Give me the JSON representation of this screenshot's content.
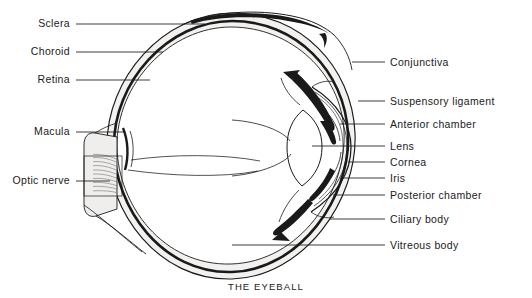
{
  "figure": {
    "caption": "THE EYEBALL",
    "ink_color": "#1a1a1a",
    "stipple_color": "#8a8a8a",
    "sclera_fill": "#f0efed",
    "background": "#ffffff"
  },
  "labels_left": [
    {
      "text": "Sclera",
      "name": "label-sclera",
      "x": 30,
      "y": 18,
      "leader_x1": 76,
      "leader_x2": 205,
      "leader_y": 24
    },
    {
      "text": "Choroid",
      "name": "label-choroid",
      "x": 21,
      "y": 46,
      "leader_x1": 76,
      "leader_x2": 163,
      "leader_y": 52
    },
    {
      "text": "Retina",
      "name": "label-retina",
      "x": 31,
      "y": 74,
      "leader_x1": 76,
      "leader_x2": 150,
      "leader_y": 80
    },
    {
      "text": "Macula",
      "name": "label-macula",
      "x": 26,
      "y": 126,
      "leader_x1": 76,
      "leader_x2": 125,
      "leader_y": 132
    },
    {
      "text": "Optic nerve",
      "name": "label-optic-nerve",
      "x": 6,
      "y": 175,
      "leader_x1": 76,
      "leader_x2": 110,
      "leader_y": 181
    }
  ],
  "labels_right": [
    {
      "text": "Suspensory  ligament",
      "name": "label-suspensory-ligament",
      "x": 390,
      "y": 96,
      "leader_x1": 358,
      "leader_x2": 385,
      "leader_y": 101
    },
    {
      "text": "Conjunctiva",
      "name": "label-conjunctiva",
      "x": 390,
      "y": 57,
      "leader_x1": 352,
      "leader_x2": 385,
      "leader_y": 62
    },
    {
      "text": "Anterior chamber",
      "name": "label-anterior-chamber",
      "x": 390,
      "y": 119,
      "leader_x1": 340,
      "leader_x2": 385,
      "leader_y": 124
    },
    {
      "text": "Lens",
      "name": "label-lens",
      "x": 390,
      "y": 141,
      "leader_x1": 312,
      "leader_x2": 385,
      "leader_y": 146
    },
    {
      "text": "Cornea",
      "name": "label-cornea",
      "x": 390,
      "y": 157,
      "leader_x1": 348,
      "leader_x2": 385,
      "leader_y": 162
    },
    {
      "text": "Iris",
      "name": "label-iris",
      "x": 390,
      "y": 173,
      "leader_x1": 340,
      "leader_x2": 385,
      "leader_y": 178
    },
    {
      "text": "Posterior chamber",
      "name": "label-posterior-chamber",
      "x": 390,
      "y": 190,
      "leader_x1": 333,
      "leader_x2": 385,
      "leader_y": 195
    },
    {
      "text": "Ciliary body",
      "name": "label-ciliary-body",
      "x": 390,
      "y": 214,
      "leader_x1": 330,
      "leader_x2": 385,
      "leader_y": 219
    },
    {
      "text": "Vitreous body",
      "name": "label-vitreous-body",
      "x": 390,
      "y": 240,
      "leader_x1": 232,
      "leader_x2": 385,
      "leader_y": 245
    }
  ],
  "anatomy_parts": [
    "sclera",
    "choroid",
    "retina",
    "macula",
    "optic-nerve",
    "conjunctiva",
    "suspensory-ligament",
    "anterior-chamber",
    "lens",
    "cornea",
    "iris",
    "posterior-chamber",
    "ciliary-body",
    "vitreous-body"
  ]
}
